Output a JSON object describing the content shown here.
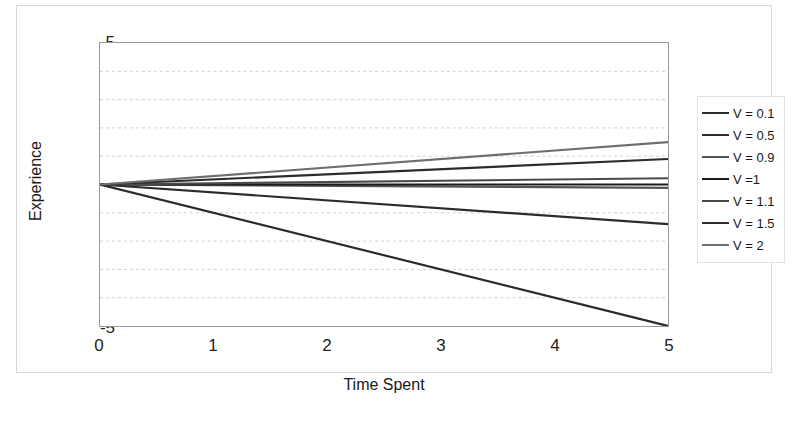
{
  "chart_data": {
    "type": "line",
    "title": "————  ————",
    "xlabel": "Time Spent",
    "ylabel": "Experience",
    "xlim": [
      0,
      5
    ],
    "ylim": [
      -5,
      5
    ],
    "xticks": [
      "0",
      "1",
      "2",
      "3",
      "4",
      "5"
    ],
    "yticks": [
      "5",
      "4",
      "3",
      "2",
      "1",
      "0",
      "-1",
      "-2",
      "-3",
      "-4",
      "-5"
    ],
    "grid": true,
    "legend_position": "right",
    "x": [
      0,
      5
    ],
    "series": [
      {
        "name": "V = 0.1",
        "values": [
          0,
          -5.0
        ],
        "color": "#2b2b2b"
      },
      {
        "name": "V = 0.5",
        "values": [
          0,
          -1.4
        ],
        "color": "#2b2b2b"
      },
      {
        "name": "V = 0.9",
        "values": [
          0,
          -0.12
        ],
        "color": "#555555"
      },
      {
        "name": "V = 1",
        "values": [
          0,
          0.0
        ],
        "color": "#1a1a1a"
      },
      {
        "name": "V = 1.1",
        "values": [
          0,
          0.22
        ],
        "color": "#4a4a4a"
      },
      {
        "name": "V = 1.5",
        "values": [
          0,
          0.9
        ],
        "color": "#2b2b2b"
      },
      {
        "name": "V = 2",
        "values": [
          0,
          1.5
        ],
        "color": "#6e6e6e"
      }
    ]
  },
  "legend": {
    "items": [
      {
        "label": "V = 0.1"
      },
      {
        "label": "V = 0.5"
      },
      {
        "label": "V = 0.9"
      },
      {
        "label": "V =1"
      },
      {
        "label": "V = 1.1"
      },
      {
        "label": "V = 1.5"
      },
      {
        "label": "V = 2"
      }
    ]
  }
}
